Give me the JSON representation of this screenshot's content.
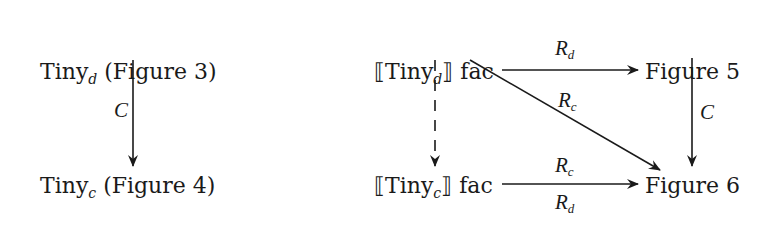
{
  "left_diagram": {
    "top_node": {
      "base": "Tiny",
      "sub": "d",
      "suffix": " (Figure 3)"
    },
    "bottom_node": {
      "base": "Tiny",
      "sub": "c",
      "suffix": " (Figure 4)"
    },
    "vertical_arrow": {
      "label": "C",
      "style": "solid"
    }
  },
  "right_diagram": {
    "top_left_node": {
      "open": "⟦",
      "base": "Tiny",
      "sub": "d",
      "close": "⟧",
      "suffix": " fac"
    },
    "top_right_node": {
      "text": "Figure 5"
    },
    "bottom_left_node": {
      "open": "⟦",
      "base": "Tiny",
      "sub": "c",
      "close": "⟧",
      "suffix": " fac"
    },
    "bottom_right_node": {
      "text": "Figure 6"
    },
    "top_arrow": {
      "label_base": "R",
      "label_sub": "d",
      "style": "solid"
    },
    "diagonal_arrow": {
      "label_base": "R",
      "label_sub": "c",
      "style": "solid"
    },
    "right_vertical_arrow": {
      "label": "C",
      "style": "solid"
    },
    "left_vertical_arrow": {
      "style": "dashed"
    },
    "bottom_arrow": {
      "label_above_base": "R",
      "label_above_sub": "c",
      "label_below_base": "R",
      "label_below_sub": "d",
      "style": "solid"
    }
  },
  "colors": {
    "ink": "#1a1a1a",
    "background": "#ffffff"
  }
}
